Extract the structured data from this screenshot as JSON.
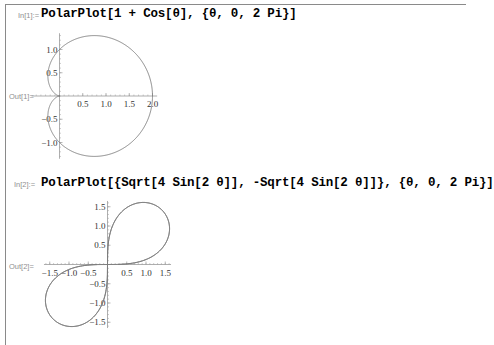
{
  "cells": [
    {
      "in_label": "In[1]:=",
      "input": "PolarPlot[1 + Cos[θ], {θ, 0, 2 Pi}]",
      "out_label": "Out[1]="
    },
    {
      "in_label": "In[2]:=",
      "input": "PolarPlot[{Sqrt[4 Sin[2 θ]], -Sqrt[4 Sin[2 θ]]}, {θ, 0, 2 Pi}]",
      "out_label": "Out[2]="
    }
  ],
  "colors": {
    "curve": "#7a7a7a",
    "axis": "#9a9a9a",
    "frame": "#8a8a8a",
    "label": "#8f8f8f"
  },
  "chart_data": [
    {
      "type": "line",
      "title": "",
      "description": "Polar plot of cardioid r = 1 + Cos[θ], θ from 0 to 2π",
      "series": [
        {
          "name": "1 + Cos[θ]",
          "r": "1+cos(t)"
        }
      ],
      "x_ticks": [
        0.5,
        1.0,
        1.5,
        2.0
      ],
      "x_tick_labels": [
        "0.5",
        "1.0",
        "1.5",
        "2.0"
      ],
      "y_ticks": [
        -1.0,
        -0.5,
        0.5,
        1.0
      ],
      "y_tick_labels": [
        "−1.0",
        "−0.5",
        "0.5",
        "1.0"
      ],
      "xlim": [
        0,
        2.0
      ],
      "ylim": [
        -1.3,
        1.3
      ],
      "grid": false,
      "origin_px": [
        59.5,
        96
      ],
      "scale_px": 46.5
    },
    {
      "type": "line",
      "title": "",
      "description": "Polar plot of r = ±Sqrt[4 Sin[2θ]], θ from 0 to 2π (lemniscate)",
      "series": [
        {
          "name": "Sqrt[4 Sin[2θ]]",
          "r": "sqrt(4sin(2t))"
        },
        {
          "name": "-Sqrt[4 Sin[2θ]]",
          "r": "-sqrt(4sin(2t))"
        }
      ],
      "x_ticks": [
        -1.5,
        -1.0,
        -0.5,
        0.5,
        1.0,
        1.5
      ],
      "x_tick_labels": [
        "−1.5",
        "−1.0",
        "−0.5",
        "0.5",
        "1.0",
        "1.5"
      ],
      "y_ticks": [
        -1.5,
        -1.0,
        -0.5,
        0.5,
        1.0,
        1.5
      ],
      "y_tick_labels": [
        "−1.5",
        "−1.0",
        "−0.5",
        "0.5",
        "1.0",
        "1.5"
      ],
      "xlim": [
        -1.62,
        1.62
      ],
      "ylim": [
        -1.62,
        1.62
      ],
      "grid": false,
      "origin_px": [
        107.5,
        264.5
      ],
      "scale_px": 38.5
    }
  ]
}
